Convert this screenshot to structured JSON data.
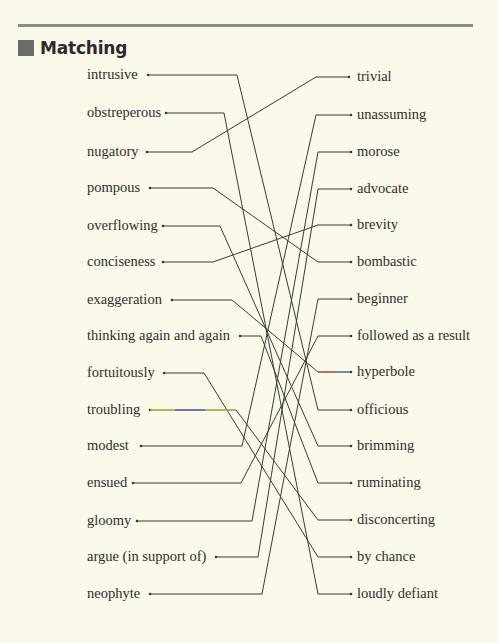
{
  "section": {
    "title": "Matching",
    "accent_color": "#6d6b68",
    "rule_color": "#8c8c86"
  },
  "left_items": [
    {
      "label": "intrusive",
      "y": 75,
      "dot_x": 148,
      "bend_x": 237
    },
    {
      "label": "obstreperous",
      "y": 113,
      "dot_x": 166,
      "bend_x": 224
    },
    {
      "label": "nugatory",
      "y": 152,
      "dot_x": 147,
      "bend_x": 192
    },
    {
      "label": "pompous",
      "y": 188,
      "dot_x": 150,
      "bend_x": 213
    },
    {
      "label": "overflowing",
      "y": 226,
      "dot_x": 163,
      "bend_x": 220
    },
    {
      "label": "conciseness",
      "y": 262,
      "dot_x": 163,
      "bend_x": 213
    },
    {
      "label": "exaggeration",
      "y": 300,
      "dot_x": 172,
      "bend_x": 232
    },
    {
      "label": "thinking again and again",
      "y": 336,
      "dot_x": 240,
      "bend_x": 261
    },
    {
      "label": "fortuitously",
      "y": 373,
      "dot_x": 164,
      "bend_x": 204
    },
    {
      "label": "troubling",
      "y": 410,
      "dot_x": 150,
      "bend_x": 236
    },
    {
      "label": "modest",
      "y": 446,
      "dot_x": 141,
      "bend_x": 242
    },
    {
      "label": "ensued",
      "y": 483,
      "dot_x": 133,
      "bend_x": 241
    },
    {
      "label": "gloomy",
      "y": 521,
      "dot_x": 137,
      "bend_x": 252
    },
    {
      "label": "argue (in support of)",
      "y": 557,
      "dot_x": 216,
      "bend_x": 258
    },
    {
      "label": "neophyte",
      "y": 594,
      "dot_x": 150,
      "bend_x": 262
    }
  ],
  "right_items": [
    {
      "label": "trivial",
      "y": 77,
      "dot_x": 349,
      "bend_x": 316
    },
    {
      "label": "unassuming",
      "y": 115,
      "dot_x": 351,
      "bend_x": 316
    },
    {
      "label": "morose",
      "y": 152,
      "dot_x": 351,
      "bend_x": 318
    },
    {
      "label": "advocate",
      "y": 189,
      "dot_x": 351,
      "bend_x": 318
    },
    {
      "label": "brevity",
      "y": 225,
      "dot_x": 351,
      "bend_x": 318
    },
    {
      "label": "bombastic",
      "y": 262,
      "dot_x": 351,
      "bend_x": 318
    },
    {
      "label": "beginner",
      "y": 299,
      "dot_x": 351,
      "bend_x": 318
    },
    {
      "label": "followed as a result",
      "y": 336,
      "dot_x": 351,
      "bend_x": 318
    },
    {
      "label": "hyperbole",
      "y": 372,
      "dot_x": 351,
      "bend_x": 318
    },
    {
      "label": "officious",
      "y": 410,
      "dot_x": 351,
      "bend_x": 318
    },
    {
      "label": "brimming",
      "y": 446,
      "dot_x": 351,
      "bend_x": 318
    },
    {
      "label": "ruminating",
      "y": 483,
      "dot_x": 351,
      "bend_x": 318
    },
    {
      "label": "disconcerting",
      "y": 520,
      "dot_x": 351,
      "bend_x": 318
    },
    {
      "label": "by chance",
      "y": 557,
      "dot_x": 351,
      "bend_x": 318
    },
    {
      "label": "loudly defiant",
      "y": 594,
      "dot_x": 351,
      "bend_x": 318
    }
  ],
  "matches": [
    {
      "left": "intrusive",
      "right": "officious"
    },
    {
      "left": "obstreperous",
      "right": "loudly defiant"
    },
    {
      "left": "nugatory",
      "right": "trivial"
    },
    {
      "left": "pompous",
      "right": "bombastic"
    },
    {
      "left": "overflowing",
      "right": "brimming"
    },
    {
      "left": "conciseness",
      "right": "brevity"
    },
    {
      "left": "exaggeration",
      "right": "hyperbole"
    },
    {
      "left": "thinking again and again",
      "right": "ruminating"
    },
    {
      "left": "fortuitously",
      "right": "by chance"
    },
    {
      "left": "troubling",
      "right": "disconcerting"
    },
    {
      "left": "modest",
      "right": "unassuming"
    },
    {
      "left": "ensued",
      "right": "followed as a result"
    },
    {
      "left": "gloomy",
      "right": "morose"
    },
    {
      "left": "argue (in support of)",
      "right": "advocate"
    },
    {
      "left": "neophyte",
      "right": "beginner"
    }
  ],
  "line_color": "#3a3a36",
  "highlights": {
    "troubling_segment": [
      "#c8c23a",
      "#5a5ad0",
      "#c8c23a"
    ],
    "hyperbole_segment": [
      "#e05050",
      "#3aa0a0"
    ]
  }
}
